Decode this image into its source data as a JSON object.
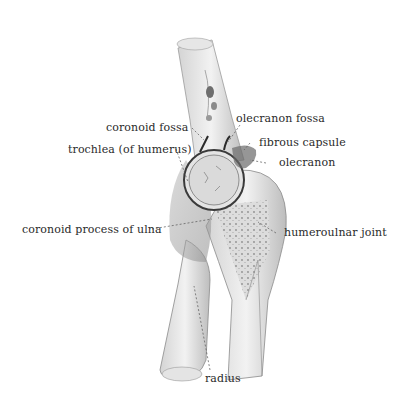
{
  "figure": {
    "labels": {
      "olecranon_fossa": "olecranon fossa",
      "coronoid_fossa": "coronoid fossa",
      "fibrous_capsule": "fibrous capsule",
      "trochlea": "trochlea (of humerus)",
      "olecranon": "olecranon",
      "coronoid_process": "coronoid process of ulna",
      "humeroulnar_joint": "humeroulnar joint",
      "radius": "radius"
    },
    "colors": {
      "background": "#ffffff",
      "text": "#2a2a2a",
      "bone_light": "#ececec",
      "bone_mid": "#c8c8c8",
      "bone_dark": "#7a7a7a",
      "outline": "#3a3a3a"
    }
  }
}
